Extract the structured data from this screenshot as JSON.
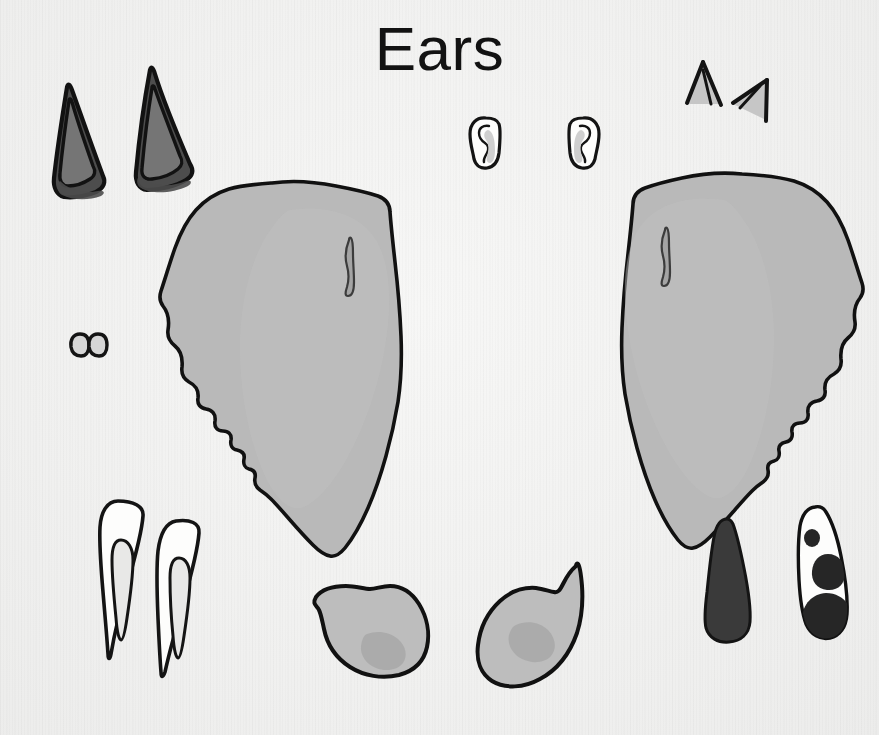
{
  "page": {
    "title": "Ears",
    "width": 879,
    "height": 735,
    "background_color": "#f2f2f1",
    "medium": "hand-drawn ink and grey marker study sheet"
  },
  "palette": {
    "paper": "#f2f2f1",
    "ink": "#111111",
    "ink_soft": "#1b1b1b",
    "grey_light": "#cfcfcf",
    "grey_mid": "#b9b9b9",
    "grey_shade": "#a8a8a8",
    "grey_dark": "#6e6e6e",
    "grey_darker": "#4d4d4d",
    "near_black": "#3a3a3a",
    "white": "#fdfdfc"
  },
  "artboard": {
    "label": "ear study sheet",
    "specimen_count": 14,
    "specimens": [
      {
        "id": "pointed-ear-left",
        "name": "pointed feline ear, left",
        "group": "pointed-pair",
        "fill": "#4d4d4d",
        "inner_fill": "#6e6e6e",
        "x": 52,
        "y": 85,
        "w": 55,
        "h": 115
      },
      {
        "id": "pointed-ear-right",
        "name": "pointed feline ear, right",
        "group": "pointed-pair",
        "fill": "#4d4d4d",
        "inner_fill": "#6e6e6e",
        "x": 128,
        "y": 68,
        "w": 62,
        "h": 122
      },
      {
        "id": "human-ear-left",
        "name": "human outer ear, left",
        "group": "human-pair",
        "fill": "#fdfdfc",
        "inner_fill": "#cfcfcf",
        "x": 470,
        "y": 114,
        "w": 32,
        "h": 52
      },
      {
        "id": "human-ear-right",
        "name": "human outer ear, right",
        "group": "human-pair",
        "fill": "#fdfdfc",
        "inner_fill": "#cfcfcf",
        "x": 568,
        "y": 114,
        "w": 32,
        "h": 52
      },
      {
        "id": "angular-ear-left",
        "name": "small angular ear, left",
        "group": "angular-pair",
        "fill": "#c6c6c6",
        "x": 684,
        "y": 60,
        "w": 38,
        "h": 48
      },
      {
        "id": "angular-ear-right",
        "name": "small angular ear, right",
        "group": "angular-pair",
        "fill": "#c6c6c6",
        "x": 730,
        "y": 78,
        "w": 40,
        "h": 44
      },
      {
        "id": "tiny-ear-left",
        "name": "tiny rounded ear, left",
        "group": "tiny-pair",
        "fill": "#d6d6d6",
        "x": 72,
        "y": 332,
        "w": 17,
        "h": 22
      },
      {
        "id": "tiny-ear-right",
        "name": "tiny rounded ear, right",
        "group": "tiny-pair",
        "fill": "#d6d6d6",
        "x": 90,
        "y": 332,
        "w": 17,
        "h": 22
      },
      {
        "id": "large-ear-left",
        "name": "large elephant ear, left",
        "group": "large-pair",
        "fill": "#b9b9b9",
        "detail": "curved ear-canal slit",
        "x": 160,
        "y": 178,
        "w": 250,
        "h": 388
      },
      {
        "id": "large-ear-right",
        "name": "large elephant ear, right",
        "group": "large-pair",
        "fill": "#b9b9b9",
        "detail": "curved ear-canal slit",
        "x": 604,
        "y": 168,
        "w": 254,
        "h": 390
      },
      {
        "id": "long-ear-left",
        "name": "long rabbit ear, left",
        "group": "long-pair",
        "fill": "#fdfdfc",
        "inner_fill": "#e4e4e3",
        "x": 96,
        "y": 498,
        "w": 50,
        "h": 160
      },
      {
        "id": "long-ear-right",
        "name": "long rabbit ear, right",
        "group": "long-pair",
        "fill": "#fdfdfc",
        "inner_fill": "#e4e4e3",
        "x": 148,
        "y": 520,
        "w": 52,
        "h": 152
      },
      {
        "id": "teardrop-ear-left",
        "name": "rounded teardrop ear, left",
        "group": "teardrop-pair",
        "fill": "#bdbdbd",
        "inner_fill": "#a8a8a8",
        "x": 312,
        "y": 583,
        "w": 115,
        "h": 95
      },
      {
        "id": "teardrop-ear-right",
        "name": "rounded teardrop ear, right",
        "group": "teardrop-pair",
        "fill": "#bdbdbd",
        "inner_fill": "#a8a8a8",
        "x": 473,
        "y": 563,
        "w": 110,
        "h": 112
      },
      {
        "id": "dark-drop-ear",
        "name": "solid dark drop ear",
        "group": "drop-pair",
        "fill": "#3a3a3a",
        "x": 703,
        "y": 518,
        "w": 47,
        "h": 120
      },
      {
        "id": "spotted-drop-ear",
        "name": "spotted drop ear",
        "group": "drop-pair",
        "fill": "#fdfdfc",
        "spot_fill": "#262626",
        "spot_count": 3,
        "x": 795,
        "y": 506,
        "w": 46,
        "h": 133
      }
    ]
  }
}
